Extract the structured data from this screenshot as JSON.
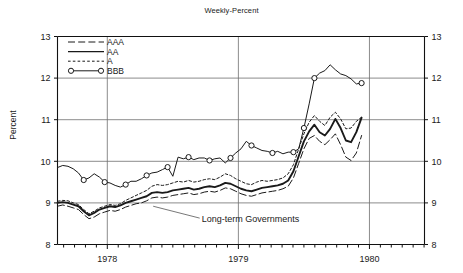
{
  "chart_data": {
    "type": "line",
    "title": "Weekly-Percent",
    "xlabel": "",
    "ylabel": "Percent",
    "ylim": [
      8,
      13
    ],
    "yticks": [
      8,
      9,
      10,
      11,
      12,
      13
    ],
    "ytick_labels_left": [
      "8",
      "9",
      "10",
      "11",
      "12",
      "13"
    ],
    "ytick_labels_right": [
      "8",
      "9",
      "10",
      "11",
      "12",
      "13"
    ],
    "xlim": [
      1977.62,
      1980.42
    ],
    "xticks": [
      1978,
      1979,
      1980
    ],
    "xtick_labels": [
      "1978",
      "1979",
      "1980"
    ],
    "grid": "horizontal-and-year-verticals",
    "legend_position": "top-left-inside",
    "annotations": [
      {
        "text": "Long-term Governments",
        "x": 1978.72,
        "y": 8.55,
        "leader_to_x": 1978.35,
        "leader_to_y": 8.92
      }
    ],
    "series": [
      {
        "name": "AAA",
        "style": "long-dash",
        "color": "#1a1a1a",
        "x": [
          1977.62,
          1977.66,
          1977.7,
          1977.74,
          1977.78,
          1977.82,
          1977.86,
          1977.9,
          1977.94,
          1977.98,
          1978.02,
          1978.06,
          1978.1,
          1978.14,
          1978.18,
          1978.22,
          1978.26,
          1978.3,
          1978.34,
          1978.38,
          1978.42,
          1978.46,
          1978.5,
          1978.54,
          1978.58,
          1978.62,
          1978.66,
          1978.7,
          1978.74,
          1978.78,
          1978.82,
          1978.86,
          1978.9,
          1978.94,
          1978.98,
          1979.02,
          1979.06,
          1979.1,
          1979.14,
          1979.18,
          1979.22,
          1979.26,
          1979.3,
          1979.34,
          1979.38,
          1979.42,
          1979.46,
          1979.5,
          1979.54,
          1979.58,
          1979.62,
          1979.66,
          1979.7,
          1979.74,
          1979.78,
          1979.82,
          1979.86,
          1979.9,
          1979.94
        ],
        "y": [
          8.92,
          8.95,
          8.92,
          8.88,
          8.84,
          8.72,
          8.62,
          8.66,
          8.74,
          8.78,
          8.82,
          8.8,
          8.84,
          8.9,
          8.94,
          8.98,
          9.0,
          9.05,
          9.12,
          9.14,
          9.12,
          9.14,
          9.18,
          9.2,
          9.22,
          9.24,
          9.2,
          9.22,
          9.26,
          9.28,
          9.26,
          9.3,
          9.36,
          9.34,
          9.28,
          9.22,
          9.18,
          9.16,
          9.2,
          9.24,
          9.26,
          9.28,
          9.3,
          9.34,
          9.4,
          9.6,
          9.95,
          10.3,
          10.55,
          10.62,
          10.48,
          10.4,
          10.52,
          10.66,
          10.4,
          10.1,
          10.02,
          10.2,
          10.62
        ]
      },
      {
        "name": "AA",
        "style": "solid",
        "color": "#1a1a1a",
        "x": [
          1977.62,
          1977.66,
          1977.7,
          1977.74,
          1977.78,
          1977.82,
          1977.86,
          1977.9,
          1977.94,
          1977.98,
          1978.02,
          1978.06,
          1978.1,
          1978.14,
          1978.18,
          1978.22,
          1978.26,
          1978.3,
          1978.34,
          1978.38,
          1978.42,
          1978.46,
          1978.5,
          1978.54,
          1978.58,
          1978.62,
          1978.66,
          1978.7,
          1978.74,
          1978.78,
          1978.82,
          1978.86,
          1978.9,
          1978.94,
          1978.98,
          1979.02,
          1979.06,
          1979.1,
          1979.14,
          1979.18,
          1979.22,
          1979.26,
          1979.3,
          1979.34,
          1979.38,
          1979.42,
          1979.46,
          1979.5,
          1979.54,
          1979.58,
          1979.62,
          1979.66,
          1979.7,
          1979.74,
          1979.78,
          1979.82,
          1979.86,
          1979.9,
          1979.94
        ],
        "y": [
          9.0,
          9.02,
          9.0,
          8.96,
          8.92,
          8.8,
          8.7,
          8.76,
          8.84,
          8.88,
          8.92,
          8.9,
          8.94,
          9.0,
          9.04,
          9.08,
          9.12,
          9.16,
          9.24,
          9.26,
          9.24,
          9.26,
          9.3,
          9.32,
          9.34,
          9.36,
          9.32,
          9.34,
          9.38,
          9.4,
          9.38,
          9.42,
          9.48,
          9.46,
          9.4,
          9.34,
          9.3,
          9.28,
          9.32,
          9.36,
          9.38,
          9.4,
          9.42,
          9.46,
          9.54,
          9.76,
          10.12,
          10.48,
          10.72,
          10.88,
          10.7,
          10.62,
          10.78,
          11.02,
          10.8,
          10.5,
          10.46,
          10.7,
          11.05
        ]
      },
      {
        "name": "A",
        "style": "short-dash",
        "color": "#1a1a1a",
        "x": [
          1977.62,
          1977.66,
          1977.7,
          1977.74,
          1977.78,
          1977.82,
          1977.86,
          1977.9,
          1977.94,
          1977.98,
          1978.02,
          1978.06,
          1978.1,
          1978.14,
          1978.18,
          1978.22,
          1978.26,
          1978.3,
          1978.34,
          1978.38,
          1978.42,
          1978.46,
          1978.5,
          1978.54,
          1978.58,
          1978.62,
          1978.66,
          1978.7,
          1978.74,
          1978.78,
          1978.82,
          1978.86,
          1978.9,
          1978.94,
          1978.98,
          1979.02,
          1979.06,
          1979.1,
          1979.14,
          1979.18,
          1979.22,
          1979.26,
          1979.3,
          1979.34,
          1979.38,
          1979.42,
          1979.46,
          1979.5,
          1979.54,
          1979.58,
          1979.62,
          1979.66,
          1979.7,
          1979.74,
          1979.78,
          1979.82,
          1979.86,
          1979.9,
          1979.94
        ],
        "y": [
          9.04,
          9.06,
          9.05,
          9.0,
          8.96,
          8.84,
          8.74,
          8.8,
          8.88,
          8.92,
          8.96,
          8.94,
          8.98,
          9.06,
          9.12,
          9.18,
          9.24,
          9.3,
          9.4,
          9.44,
          9.42,
          9.44,
          9.48,
          9.52,
          9.5,
          9.54,
          9.5,
          9.52,
          9.56,
          9.58,
          9.56,
          9.62,
          9.7,
          9.66,
          9.58,
          9.52,
          9.46,
          9.44,
          9.5,
          9.54,
          9.52,
          9.54,
          9.56,
          9.6,
          9.7,
          9.92,
          10.3,
          10.66,
          10.94,
          11.1,
          10.96,
          10.86,
          11.06,
          11.18,
          11.02,
          10.78,
          10.8,
          10.96,
          11.06
        ]
      },
      {
        "name": "BBB",
        "style": "solid-with-markers",
        "color": "#1a1a1a",
        "x": [
          1977.62,
          1977.66,
          1977.7,
          1977.74,
          1977.78,
          1977.82,
          1977.86,
          1977.9,
          1977.94,
          1977.98,
          1978.02,
          1978.06,
          1978.1,
          1978.14,
          1978.18,
          1978.22,
          1978.26,
          1978.3,
          1978.34,
          1978.38,
          1978.42,
          1978.46,
          1978.5,
          1978.54,
          1978.58,
          1978.62,
          1978.66,
          1978.7,
          1978.74,
          1978.78,
          1978.82,
          1978.86,
          1978.9,
          1978.94,
          1978.98,
          1979.02,
          1979.06,
          1979.1,
          1979.14,
          1979.18,
          1979.22,
          1979.26,
          1979.3,
          1979.34,
          1979.38,
          1979.42,
          1979.46,
          1979.5,
          1979.54,
          1979.58,
          1979.62,
          1979.66,
          1979.7,
          1979.74,
          1979.78,
          1979.82,
          1979.86,
          1979.9,
          1979.94
        ],
        "y": [
          9.85,
          9.9,
          9.88,
          9.82,
          9.72,
          9.55,
          9.6,
          9.7,
          9.62,
          9.5,
          9.48,
          9.42,
          9.38,
          9.44,
          9.52,
          9.52,
          9.58,
          9.66,
          9.72,
          9.74,
          9.8,
          9.86,
          9.64,
          10.1,
          10.06,
          10.1,
          10.04,
          10.08,
          10.08,
          10.02,
          10.06,
          10.08,
          9.96,
          10.08,
          10.2,
          10.3,
          10.48,
          10.38,
          10.32,
          10.26,
          10.24,
          10.2,
          10.24,
          10.18,
          10.22,
          10.22,
          10.3,
          10.8,
          11.38,
          12.0,
          12.12,
          12.18,
          12.32,
          12.2,
          12.1,
          12.06,
          11.98,
          11.86,
          11.88
        ],
        "markers_at": [
          1977.82,
          1977.98,
          1978.14,
          1978.3,
          1978.46,
          1978.62,
          1978.78,
          1978.94,
          1979.1,
          1979.26,
          1979.42,
          1979.5,
          1979.58,
          1979.94
        ]
      }
    ],
    "legend": [
      {
        "label": "AAA",
        "style": "long-dash"
      },
      {
        "label": "AA",
        "style": "solid"
      },
      {
        "label": "A",
        "style": "short-dash"
      },
      {
        "label": "BBB",
        "style": "solid-with-markers"
      }
    ]
  }
}
